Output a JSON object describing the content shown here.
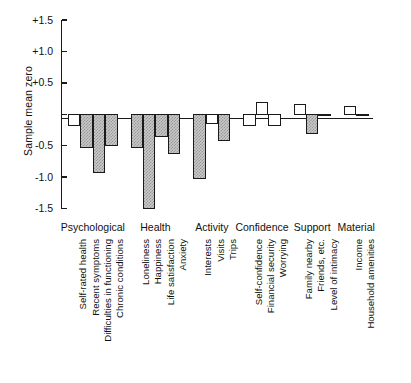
{
  "chart_data": {
    "type": "bar",
    "title": "",
    "subtitle": "",
    "xlabel": "",
    "ylabel": "Sample mean zero",
    "ylim": [
      -1.5,
      1.5
    ],
    "ytick_labels": [
      "+1.5",
      "+1.0",
      "+0.5",
      "",
      "-0.5",
      "-1.0",
      "-1.5"
    ],
    "ytick_values": [
      1.5,
      1.0,
      0.5,
      0.0,
      -0.5,
      -1.0,
      -1.5
    ],
    "grid": false,
    "legend_position": "none",
    "zero_reference_line": true,
    "fill_styles": {
      "filled": "hatched-grey",
      "open": "white"
    },
    "groups": [
      {
        "name": "Psychological",
        "categories": [
          "Self-rated health",
          "Recent symptoms",
          "Difficulties in functioning",
          "Chronic conditions"
        ],
        "values": [
          -0.18,
          -0.52,
          -0.92,
          -0.5
        ],
        "fills": [
          "open",
          "filled",
          "filled",
          "filled"
        ]
      },
      {
        "name": "Health",
        "categories": [
          "Loneliness",
          "Happiness",
          "Life satisfaction",
          "Anxiety"
        ],
        "values": [
          -0.52,
          -1.5,
          -0.35,
          -0.62
        ],
        "fills": [
          "filled",
          "filled",
          "filled",
          "filled"
        ]
      },
      {
        "name": "Activity",
        "categories": [
          "Interests",
          "Visits",
          "Trips"
        ],
        "values": [
          -1.02,
          -0.15,
          -0.42
        ],
        "fills": [
          "filled",
          "open",
          "filled"
        ]
      },
      {
        "name": "Confidence",
        "categories": [
          "Self-confidence",
          "Financial security",
          "Worrying"
        ],
        "values": [
          -0.18,
          0.18,
          -0.18
        ],
        "fills": [
          "open",
          "open",
          "open"
        ]
      },
      {
        "name": "Support",
        "categories": [
          "Family nearby",
          "Friends, etc.",
          "Level of intimacy"
        ],
        "values": [
          0.15,
          -0.3,
          0.0
        ],
        "fills": [
          "open",
          "filled",
          "open"
        ]
      },
      {
        "name": "Material",
        "categories": [
          "Income",
          "Household amenities"
        ],
        "values": [
          0.12,
          0.0
        ],
        "fills": [
          "open",
          "open"
        ]
      }
    ]
  },
  "colors": {
    "axis": "#1a1a1a",
    "bar_outline": "#1a1a1a",
    "bar_fill": "#c9c9c9",
    "background": "#ffffff"
  }
}
